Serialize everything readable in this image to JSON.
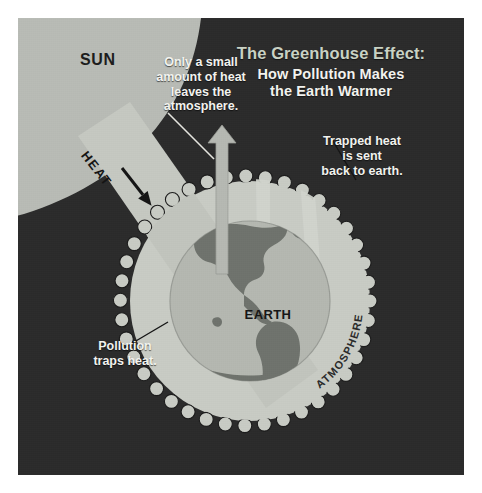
{
  "poster": {
    "background_color": "#ffffff",
    "artboard_color": "#2b2b2b"
  },
  "title": {
    "main": "The Greenhouse Effect:",
    "sub": "How Pollution Makes\nthe Earth Warmer",
    "main_color": "#c9d2c4",
    "sub_color": "#f2f2ee"
  },
  "labels": {
    "sun": "SUN",
    "earth": "EARTH",
    "atmosphere": "ATMOSPHERE",
    "heat": "HEAT"
  },
  "callouts": {
    "escape": "Only a small\namount of heat\nleaves the\natmosphere.",
    "trapped": "Trapped heat\nis sent\nback to earth.",
    "pollution": "Pollution\ntraps heat."
  },
  "colors": {
    "sun_fill": "#b9bcb6",
    "beam_fill": "#c6c9c2",
    "atmosphere_fill": "#c9ccc5",
    "earth_fill": "#b5b8b1",
    "land_fill": "#6f736d",
    "outline": "#1b1b1b",
    "arrow_fill": "#b6b9b3"
  },
  "icons": {
    "escape_arrow": "arrow-up-icon",
    "heat_arrow": "arrow-down-right-icon",
    "leader_line": "leader-line-icon"
  }
}
